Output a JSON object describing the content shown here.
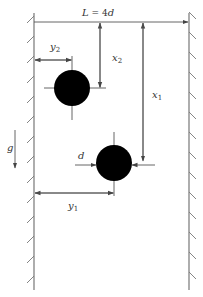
{
  "diagram": {
    "title_label": {
      "main": "L",
      "eq": " = 4",
      "var": "d"
    },
    "labels": {
      "x1": {
        "main": "x",
        "sub": "1"
      },
      "x2": {
        "main": "x",
        "sub": "2"
      },
      "y1": {
        "main": "y",
        "sub": "1"
      },
      "y2": {
        "main": "y",
        "sub": "2"
      },
      "d": "d",
      "g": "g"
    },
    "elements": {
      "left_wall": "left-wall",
      "right_wall": "right-wall",
      "particle_1": "particle-1",
      "particle_2": "particle-2",
      "gravity_arrow": "gravity-arrow"
    },
    "colors": {
      "particle": "#000000",
      "line": "#555555",
      "wall": "#777777",
      "background": "#ffffff"
    }
  }
}
